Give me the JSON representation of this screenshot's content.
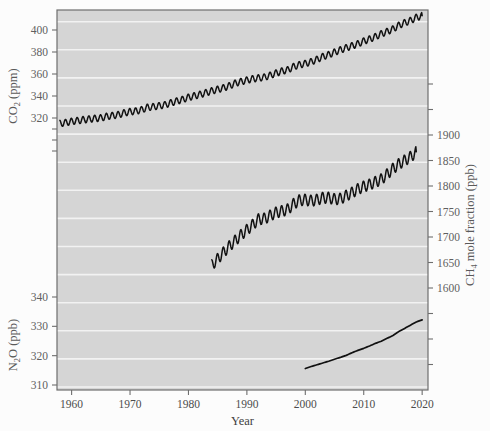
{
  "chart_data": {
    "type": "line",
    "title": "",
    "xlabel": "Year",
    "grid": "horizontal-white-gridlines",
    "legend": "none",
    "panel_background": "#d5d5d5",
    "line_color": "#111111",
    "xlim": [
      1957.5,
      2021.0
    ],
    "xticks": [
      1960,
      1970,
      1980,
      1990,
      2000,
      2010,
      2020
    ],
    "xticklabels": [
      "1960",
      "1970",
      "1980",
      "1990",
      "2000",
      "2010",
      "2020"
    ],
    "axes": [
      {
        "id": "co2",
        "side": "left",
        "label": "CO2 (ppm)",
        "label_parts": {
          "pre": "CO",
          "sub": "2",
          "post": " (ppm)"
        },
        "unit": "ppm",
        "ticks": [
          320,
          340,
          360,
          380,
          400
        ],
        "ticklabels": [
          "320",
          "340",
          "360",
          "380",
          "400"
        ]
      },
      {
        "id": "n2o",
        "side": "left",
        "label": "N2O (ppb)",
        "label_parts": {
          "pre": "N",
          "sub": "2",
          "post": "O (ppb)"
        },
        "unit": "ppb",
        "ticks": [
          310,
          320,
          330,
          340
        ],
        "ticklabels": [
          "310",
          "320",
          "330",
          "340"
        ]
      },
      {
        "id": "ch4",
        "side": "right",
        "label": "CH4 mole fraction (ppb)",
        "label_parts": {
          "pre": "CH",
          "sub": "4",
          "post": " mole fraction (ppb)"
        },
        "unit": "ppb",
        "ticks": [
          1600,
          1650,
          1700,
          1750,
          1800,
          1850,
          1900
        ],
        "ticklabels": [
          "1600",
          "1650",
          "1700",
          "1750",
          "1800",
          "1850",
          "1900"
        ]
      }
    ],
    "series": [
      {
        "name": "CO2",
        "axis": "co2",
        "unit": "ppm",
        "seasonal_cycle": true,
        "seasonal_amplitude_ppm": 3.0,
        "x": [
          1958,
          1959,
          1960,
          1961,
          1962,
          1963,
          1964,
          1965,
          1966,
          1967,
          1968,
          1969,
          1970,
          1971,
          1972,
          1973,
          1974,
          1975,
          1976,
          1977,
          1978,
          1979,
          1980,
          1981,
          1982,
          1983,
          1984,
          1985,
          1986,
          1987,
          1988,
          1989,
          1990,
          1991,
          1992,
          1993,
          1994,
          1995,
          1996,
          1997,
          1998,
          1999,
          2000,
          2001,
          2002,
          2003,
          2004,
          2005,
          2006,
          2007,
          2008,
          2009,
          2010,
          2011,
          2012,
          2013,
          2014,
          2015,
          2016,
          2017,
          2018,
          2019,
          2020
        ],
        "values": [
          315.0,
          315.8,
          316.9,
          317.6,
          318.4,
          319.0,
          319.6,
          320.0,
          321.4,
          322.2,
          323.0,
          324.6,
          325.7,
          326.3,
          327.5,
          329.7,
          330.2,
          331.1,
          332.0,
          333.8,
          335.4,
          336.8,
          338.8,
          340.1,
          341.4,
          343.0,
          344.6,
          346.0,
          347.4,
          349.2,
          351.6,
          353.1,
          354.4,
          355.6,
          356.4,
          357.1,
          358.8,
          360.8,
          362.6,
          363.7,
          366.7,
          368.4,
          369.5,
          371.1,
          373.2,
          375.8,
          377.5,
          379.8,
          381.9,
          383.8,
          385.6,
          387.4,
          389.9,
          391.7,
          393.9,
          396.5,
          398.6,
          400.8,
          404.2,
          406.6,
          408.5,
          411.4,
          413.0
        ]
      },
      {
        "name": "CH4",
        "axis": "ch4",
        "unit": "ppb",
        "seasonal_cycle": true,
        "seasonal_amplitude_ppb": 11.0,
        "x": [
          1984,
          1985,
          1986,
          1987,
          1988,
          1989,
          1990,
          1991,
          1992,
          1993,
          1994,
          1995,
          1996,
          1997,
          1998,
          1999,
          2000,
          2001,
          2002,
          2003,
          2004,
          2005,
          2006,
          2007,
          2008,
          2009,
          2010,
          2011,
          2012,
          2013,
          2014,
          2015,
          2016,
          2017,
          2018,
          2019
        ],
        "values": [
          1645,
          1657,
          1670,
          1682,
          1693,
          1704,
          1714,
          1724,
          1735,
          1736,
          1742,
          1748,
          1751,
          1754,
          1765,
          1772,
          1773,
          1771,
          1773,
          1777,
          1777,
          1774,
          1775,
          1781,
          1787,
          1794,
          1799,
          1803,
          1808,
          1813,
          1823,
          1834,
          1843,
          1850,
          1857,
          1867
        ]
      },
      {
        "name": "N2O",
        "axis": "n2o",
        "unit": "ppb",
        "seasonal_cycle": false,
        "x": [
          2000,
          2001,
          2002,
          2003,
          2004,
          2005,
          2006,
          2007,
          2008,
          2009,
          2010,
          2011,
          2012,
          2013,
          2014,
          2015,
          2016,
          2017,
          2018,
          2019,
          2020
        ],
        "values": [
          315.6,
          316.3,
          316.9,
          317.5,
          318.1,
          318.8,
          319.4,
          320.1,
          321.0,
          321.8,
          322.5,
          323.3,
          324.2,
          324.9,
          325.9,
          326.9,
          328.2,
          329.3,
          330.4,
          331.5,
          332.2
        ]
      }
    ]
  }
}
